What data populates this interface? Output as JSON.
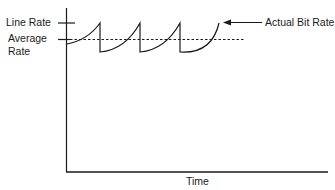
{
  "diagram": {
    "type": "sawtooth-rate-graph",
    "labels": {
      "line_rate": "Line Rate",
      "average_rate_line1": "Average",
      "average_rate_line2": "Rate",
      "actual_bit_rate": "Actual Bit Rate",
      "x_axis": "Time"
    },
    "colors": {
      "stroke": "#1a1a1a",
      "background": "#ffffff"
    },
    "series": {
      "peaks_count": 4,
      "line_rate_level": "max",
      "average_rate_level": "dashed",
      "shape": "concave-up rising curve then vertical drop (sawtooth)"
    }
  }
}
